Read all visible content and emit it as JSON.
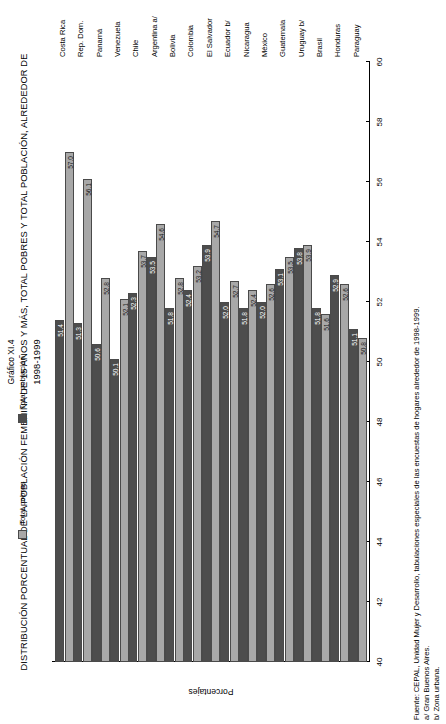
{
  "header": {
    "figure_number": "Gráfico XI.4",
    "title": "DISTRIBUCIÓN PORCENTUAL DE LA POBLACIÓN FEMENINA DE 15 AÑOS Y MÁS, TOTAL POBRES Y TOTAL POBLACIÓN, ALREDEDOR DE",
    "subtitle": "1998-1999"
  },
  "legend": {
    "items": [
      {
        "label": "Total pobres",
        "color": "#a8a8a8"
      },
      {
        "label": "Total población",
        "color": "#4d4d4d"
      }
    ]
  },
  "footer": {
    "source": "Fuente: CEPAL, Unidad Mujer y Desarrollo, tabulaciones especiales de las encuestas de hogares alrededor de 1998-1999.",
    "note_a": "a/ Gran Buenos Aires.",
    "note_b": "b/ Zona urbana."
  },
  "chart_data": {
    "type": "bar",
    "orientation": "vertical",
    "title": "DISTRIBUCIÓN PORCENTUAL DE LA POBLACIÓN FEMENINA DE 15 AÑOS Y MÁS, TOTAL POBRES Y TOTAL POBLACIÓN, ALREDEDOR DE 1998-1999",
    "xlabel": "",
    "ylabel": "Porcentajes",
    "ylim": [
      40,
      60
    ],
    "yticks": [
      40,
      42,
      44,
      46,
      48,
      50,
      52,
      54,
      56,
      58,
      60
    ],
    "grid": false,
    "legend_position": "top",
    "categories": [
      "Costa Rica",
      "Rep. Dom.",
      "Panamá",
      "Venezuela",
      "Chile",
      "Argentina a/",
      "Bolivia",
      "Colombia",
      "El Salvador",
      "Ecuador b/",
      "Nicaragua",
      "México",
      "Guatemala",
      "Uruguay b/",
      "Brasil",
      "Honduras",
      "Paraguay"
    ],
    "series": [
      {
        "name": "Total pobres",
        "color": "#a8a8a8",
        "values": [
          57.0,
          56.1,
          52.8,
          52.1,
          53.7,
          54.6,
          52.8,
          53.2,
          54.7,
          52.7,
          52.4,
          52.6,
          53.5,
          53.9,
          51.6,
          52.6,
          50.8
        ]
      },
      {
        "name": "Total población",
        "color": "#4d4d4d",
        "values": [
          51.4,
          51.3,
          50.6,
          50.1,
          52.3,
          53.5,
          51.8,
          52.4,
          53.9,
          52.0,
          51.8,
          52.0,
          53.1,
          53.8,
          51.8,
          52.9,
          51.1
        ]
      }
    ]
  }
}
